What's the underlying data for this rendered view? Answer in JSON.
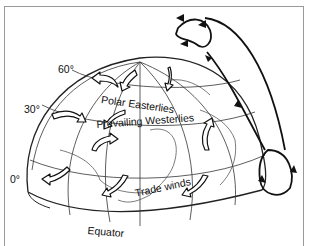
{
  "diagram": {
    "latitude_labels": [
      {
        "label": "60°",
        "x": 58,
        "y": 64
      },
      {
        "label": "30°",
        "x": 24,
        "y": 104
      },
      {
        "label": "0°",
        "x": 10,
        "y": 174
      }
    ],
    "wind_belts": [
      {
        "label": "Polar Easterlies",
        "x": 102,
        "y": 94,
        "rotate": 8
      },
      {
        "label": "Prevailing Westerlies",
        "x": 96,
        "y": 119,
        "rotate": -4
      },
      {
        "label": "Trade winds",
        "x": 134,
        "y": 188,
        "rotate": -12
      }
    ],
    "equator_label": {
      "label": "Equator",
      "x": 88,
      "y": 225,
      "rotate": 5
    },
    "colors": {
      "line": "#111111",
      "frame": "#9a9a9a",
      "background": "#ffffff"
    }
  }
}
